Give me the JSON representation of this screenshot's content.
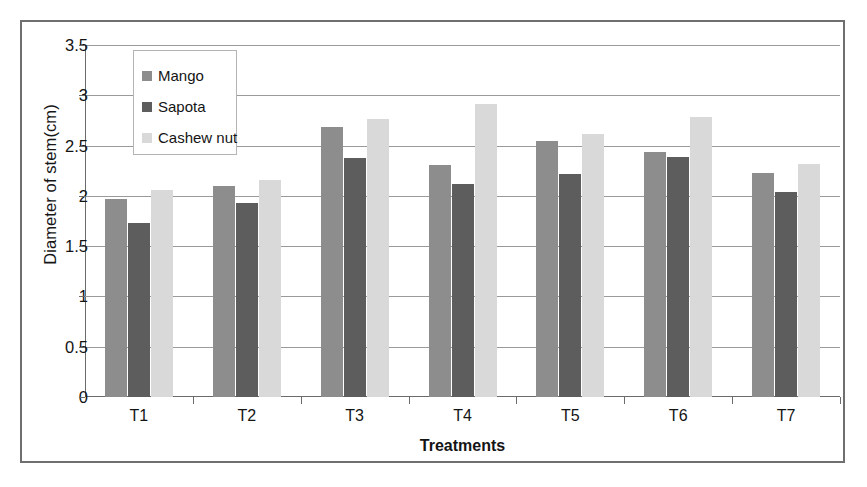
{
  "chart_data": {
    "type": "bar",
    "title": "",
    "xlabel": "Treatments",
    "ylabel": "Diameter of stem(cm)",
    "categories": [
      "T1",
      "T2",
      "T3",
      "T4",
      "T5",
      "T6",
      "T7"
    ],
    "series": [
      {
        "name": "Mango",
        "color": "#8d8d8d",
        "values": [
          1.97,
          2.1,
          2.68,
          2.31,
          2.55,
          2.44,
          2.23
        ]
      },
      {
        "name": "Sapota",
        "color": "#5d5d5d",
        "values": [
          1.73,
          1.93,
          2.38,
          2.12,
          2.22,
          2.39,
          2.04
        ]
      },
      {
        "name": "Cashew nut",
        "color": "#d9d9d9",
        "values": [
          2.06,
          2.16,
          2.76,
          2.91,
          2.62,
          2.78,
          2.32
        ]
      }
    ],
    "ylim": [
      0,
      3.5
    ],
    "ytick_labels": [
      "0",
      "0.5",
      "1",
      "1.5",
      "2",
      "2.5",
      "3",
      "3.5"
    ],
    "ytick_values": [
      0,
      0.5,
      1,
      1.5,
      2,
      2.5,
      3,
      3.5
    ],
    "grid": true,
    "legend_position": "upper-left-inside"
  }
}
